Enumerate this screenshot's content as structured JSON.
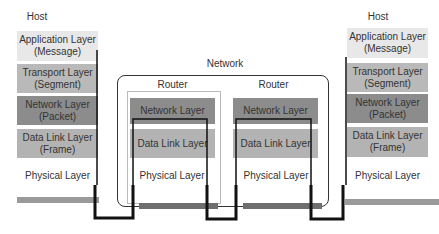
{
  "network": {
    "label": "Network"
  },
  "host_left": {
    "label": "Host",
    "layers": [
      {
        "name": "Application Layer",
        "unit": "(Message)"
      },
      {
        "name": "Transport Layer",
        "unit": "(Segment)"
      },
      {
        "name": "Network Layer",
        "unit": "(Packet)"
      },
      {
        "name": "Data Link Layer",
        "unit": "(Frame)"
      },
      {
        "name": "Physical Layer"
      }
    ]
  },
  "host_right": {
    "label": "Host",
    "layers": [
      {
        "name": "Application Layer",
        "unit": "(Message)"
      },
      {
        "name": "Transport Layer",
        "unit": "(Segment)"
      },
      {
        "name": "Network Layer",
        "unit": "(Packet)"
      },
      {
        "name": "Data Link Layer",
        "unit": "(Frame)"
      },
      {
        "name": "Physical Layer"
      }
    ]
  },
  "routers": [
    {
      "label": "Router",
      "layers": [
        "Network Layer",
        "Data Link Layer",
        "Physical Layer"
      ]
    },
    {
      "label": "Router",
      "layers": [
        "Network Layer",
        "Data Link Layer",
        "Physical Layer"
      ]
    }
  ],
  "colors": {
    "application": "#e8e8e8",
    "transport": "#b9b9b9",
    "network": "#8c8c8c",
    "datalink": "#b3b3b3",
    "path": "#111111"
  }
}
